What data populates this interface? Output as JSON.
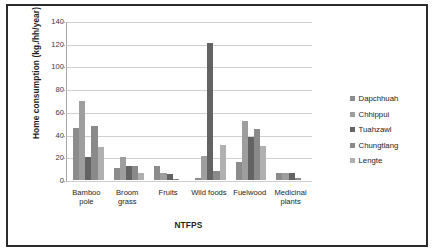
{
  "chart_data": {
    "type": "bar",
    "title": "",
    "xlabel": "NTFPS",
    "ylabel": "Home consumption (kg./hh/year)",
    "ylim": [
      0,
      140
    ],
    "ytick_step": 20,
    "yticks": [
      140,
      120,
      100,
      80,
      60,
      40,
      20,
      0
    ],
    "grid": true,
    "legend_position": "right",
    "categories": [
      "Bamboo pole",
      "Broom grass",
      "Fruits",
      "Wild foods",
      "Fuelwood",
      "Medicinal plants"
    ],
    "series": [
      {
        "name": "Dapchhuah",
        "color": "#8c8c8c",
        "values": [
          46,
          11,
          12,
          2,
          16,
          6
        ]
      },
      {
        "name": "Chhippui",
        "color": "#9e9e9e",
        "values": [
          70,
          20,
          6,
          21,
          52,
          6
        ]
      },
      {
        "name": "Tuahzawl",
        "color": "#636363",
        "values": [
          20,
          12,
          5,
          121,
          38,
          6
        ]
      },
      {
        "name": "Chungtlang",
        "color": "#8a8a8a",
        "values": [
          48,
          12,
          1,
          8,
          45,
          2
        ]
      },
      {
        "name": "Lengte",
        "color": "#b0b0b0",
        "values": [
          29,
          6,
          0,
          31,
          30,
          0
        ]
      }
    ]
  }
}
